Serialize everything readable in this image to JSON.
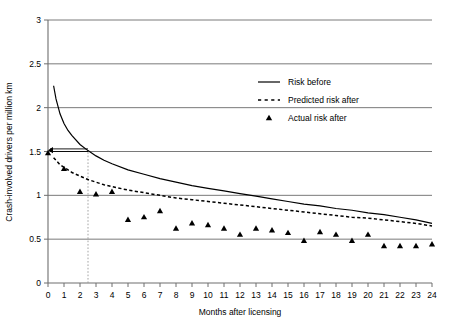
{
  "chart_data": {
    "type": "line",
    "title": "",
    "xlabel": "Months after licensing",
    "ylabel": "Crash-involved drivers per million km",
    "xlim": [
      0,
      24
    ],
    "ylim": [
      0,
      3
    ],
    "xticks": [
      0,
      1,
      2,
      3,
      4,
      5,
      6,
      7,
      8,
      9,
      10,
      11,
      12,
      13,
      14,
      15,
      16,
      17,
      18,
      19,
      20,
      21,
      22,
      23,
      24
    ],
    "xtick_labels": [
      "0",
      "1",
      "2",
      "3",
      "4",
      "5",
      "6",
      "7",
      "8",
      "9",
      "10",
      "11",
      "12",
      "13",
      "14",
      "15",
      "16",
      "17",
      "18",
      "19",
      "20",
      "21",
      "22",
      "23",
      "24"
    ],
    "yticks": [
      0,
      0.5,
      1,
      1.5,
      2,
      2.5,
      3
    ],
    "ytick_labels": [
      "0",
      "0.5",
      "1",
      "1.5",
      "2",
      "2.5",
      "3"
    ],
    "grid": "horizontal",
    "legend_position": "upper-right",
    "series": [
      {
        "name": "Risk before",
        "style": "solid-line",
        "x": [
          0.35,
          0.5,
          0.75,
          1,
          1.25,
          1.5,
          2,
          2.5,
          3,
          3.5,
          4,
          5,
          6,
          7,
          8,
          9,
          10,
          11,
          12,
          13,
          14,
          15,
          16,
          17,
          18,
          19,
          20,
          21,
          22,
          23,
          24
        ],
        "values": [
          2.25,
          2.1,
          1.93,
          1.82,
          1.74,
          1.68,
          1.58,
          1.51,
          1.45,
          1.4,
          1.36,
          1.29,
          1.24,
          1.19,
          1.15,
          1.11,
          1.08,
          1.05,
          1.02,
          0.99,
          0.96,
          0.93,
          0.9,
          0.88,
          0.85,
          0.83,
          0.8,
          0.78,
          0.75,
          0.72,
          0.68
        ]
      },
      {
        "name": "Predicted risk after",
        "style": "dashed-line",
        "x": [
          0.35,
          0.5,
          0.75,
          1,
          1.25,
          1.5,
          2,
          2.5,
          3,
          3.5,
          4,
          5,
          6,
          7,
          8,
          9,
          10,
          11,
          12,
          13,
          14,
          15,
          16,
          17,
          18,
          19,
          20,
          21,
          22,
          23,
          24
        ],
        "values": [
          1.43,
          1.4,
          1.35,
          1.32,
          1.29,
          1.26,
          1.22,
          1.18,
          1.15,
          1.12,
          1.1,
          1.06,
          1.03,
          1.0,
          0.97,
          0.95,
          0.93,
          0.91,
          0.89,
          0.87,
          0.85,
          0.83,
          0.81,
          0.79,
          0.77,
          0.75,
          0.74,
          0.72,
          0.7,
          0.68,
          0.65
        ]
      },
      {
        "name": "Actual risk after",
        "style": "triangle-markers",
        "x": [
          0,
          1,
          2,
          3,
          4,
          5,
          6,
          7,
          8,
          9,
          10,
          11,
          12,
          13,
          14,
          15,
          16,
          17,
          18,
          19,
          20,
          21,
          22,
          23,
          24
        ],
        "values": [
          1.48,
          1.3,
          1.04,
          1.01,
          1.04,
          0.72,
          0.75,
          0.82,
          0.62,
          0.68,
          0.66,
          0.62,
          0.55,
          0.62,
          0.6,
          0.57,
          0.48,
          0.58,
          0.55,
          0.48,
          0.55,
          0.42,
          0.42,
          0.42,
          0.44
        ]
      }
    ],
    "annotations": [
      {
        "name": "reference-arrow",
        "type": "horizontal-arrow",
        "y": 1.5,
        "x_from": 2.5,
        "x_to": 0
      },
      {
        "name": "reference-dotted-vertical",
        "type": "vertical-dotted",
        "x": 2.5,
        "y_from": 0,
        "y_to": 1.5
      }
    ]
  },
  "legend": {
    "entries": [
      {
        "label": "Risk before",
        "marker": "solid-line"
      },
      {
        "label": "Predicted risk after",
        "marker": "dashed-line"
      },
      {
        "label": "Actual risk after",
        "marker": "triangle"
      }
    ]
  }
}
